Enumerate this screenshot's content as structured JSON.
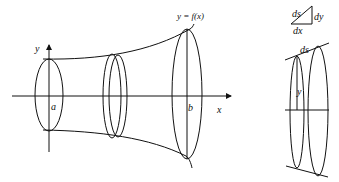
{
  "left_diagram": {
    "axis_y_label": "y",
    "axis_x_label": "x",
    "label_a": "a",
    "label_b": "b",
    "curve_label": "y = f(x)"
  },
  "right_diagram": {
    "triangle": {
      "hyp": "ds",
      "vert": "dy",
      "horiz": "dx"
    },
    "band_top_label": "ds",
    "radius_label": "y"
  }
}
